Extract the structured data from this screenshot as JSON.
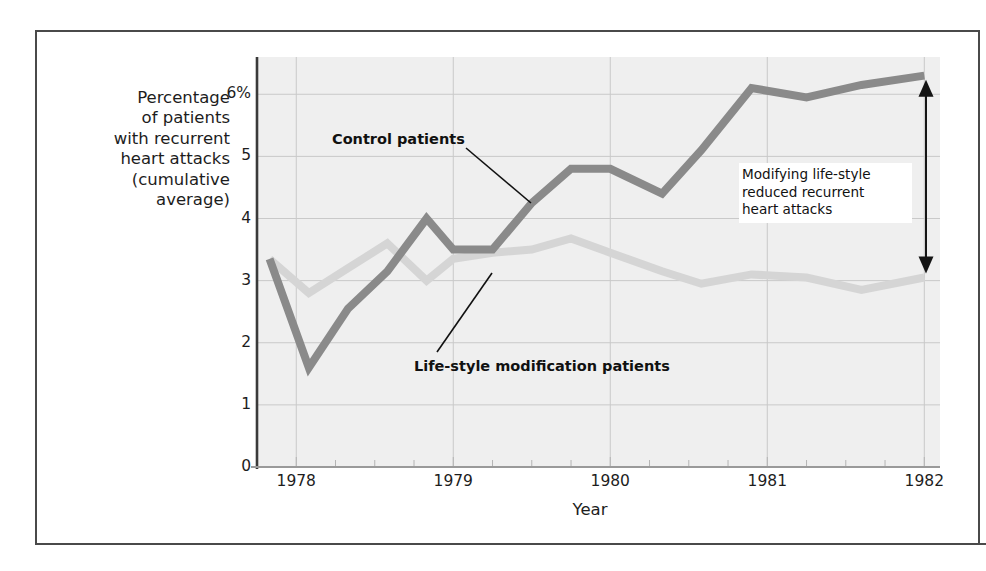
{
  "chart_data": {
    "type": "line",
    "title": "",
    "xlabel": "Year",
    "ylabel": "Percentage of patients with recurrent heart attacks (cumulative average)",
    "ylabel_lines": [
      "Percentage",
      "of patients",
      "with recurrent",
      "heart attacks",
      "(cumulative",
      "average)"
    ],
    "xlim": [
      1977.75,
      1982.1
    ],
    "ylim": [
      0,
      6.6
    ],
    "y_ticks": [
      0,
      1,
      2,
      3,
      4,
      5,
      6
    ],
    "y_tick_labels": [
      "0",
      "1",
      "2",
      "3",
      "4",
      "5",
      "6%"
    ],
    "x_ticks": [
      1978,
      1979,
      1980,
      1981,
      1982
    ],
    "x_tick_labels": [
      "1978",
      "1979",
      "1980",
      "1981",
      "1982"
    ],
    "x_minor_tick_interval": 0.25,
    "grid": true,
    "legend_position": "inline-annotations",
    "plot_background": "#efefef",
    "series": [
      {
        "name": "Control patients",
        "color": "#8a8a8a",
        "x": [
          1977.83,
          1978.08,
          1978.33,
          1978.58,
          1978.83,
          1979.0,
          1979.25,
          1979.5,
          1979.75,
          1980.0,
          1980.33,
          1980.58,
          1980.9,
          1981.25,
          1981.6,
          1982.0
        ],
        "values": [
          3.35,
          1.6,
          2.55,
          3.15,
          4.0,
          3.5,
          3.5,
          4.25,
          4.8,
          4.8,
          4.4,
          5.1,
          6.1,
          5.95,
          6.15,
          6.3
        ]
      },
      {
        "name": "Life-style modification patients",
        "color": "#d5d5d5",
        "x": [
          1977.83,
          1978.08,
          1978.33,
          1978.58,
          1978.83,
          1979.0,
          1979.25,
          1979.5,
          1979.75,
          1980.0,
          1980.33,
          1980.58,
          1980.9,
          1981.25,
          1981.6,
          1982.0
        ],
        "values": [
          3.35,
          2.8,
          3.2,
          3.6,
          3.0,
          3.35,
          3.45,
          3.5,
          3.68,
          3.45,
          3.15,
          2.95,
          3.1,
          3.05,
          2.85,
          3.05
        ]
      }
    ],
    "annotations": [
      {
        "name": "control-patients-label",
        "text": "Control patients",
        "kind": "leader-label"
      },
      {
        "name": "lifestyle-patients-label",
        "text": "Life-style modification patients",
        "kind": "leader-label"
      },
      {
        "name": "difference-note",
        "text": "Modifying life-style reduced recurrent heart attacks",
        "lines": [
          "Modifying life-style",
          "reduced recurrent",
          "heart attacks"
        ],
        "kind": "boxed-note-with-double-arrow",
        "arrow_top_value": 6.3,
        "arrow_bottom_value": 3.05
      }
    ]
  },
  "colors": {
    "frame": "#4a4a4a",
    "plot_bg": "#efefef",
    "grid": "#c9c9c9",
    "axis": "#3a3a3a",
    "control_line": "#8a8a8a",
    "lifestyle_line": "#d5d5d5",
    "text": "#1d1d1d",
    "arrow": "#151515"
  }
}
